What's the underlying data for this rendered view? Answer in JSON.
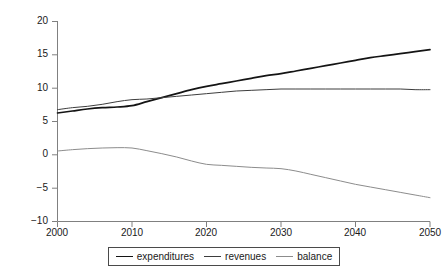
{
  "chart_data": {
    "type": "line",
    "title": "",
    "subtitle": "",
    "xlabel": "",
    "ylabel": "percentage of GDP",
    "xlim": [
      2000,
      2050
    ],
    "ylim": [
      -10,
      20
    ],
    "grid": false,
    "legend_position": "bottom",
    "x_ticks": [
      "2000",
      "2010",
      "2020",
      "2030",
      "2040",
      "2050"
    ],
    "y_ticks": [
      "20",
      "15",
      "10",
      "5",
      "0",
      "−5",
      "−10"
    ],
    "x": [
      2000,
      2002,
      2004,
      2006,
      2008,
      2010,
      2012,
      2014,
      2016,
      2018,
      2020,
      2022,
      2024,
      2026,
      2028,
      2030,
      2032,
      2034,
      2036,
      2038,
      2040,
      2042,
      2044,
      2046,
      2048,
      2050
    ],
    "series": [
      {
        "name": "expenditures",
        "color": "#141414",
        "width": 1.7,
        "values": [
          6.2,
          6.5,
          6.8,
          7.0,
          7.1,
          7.3,
          7.9,
          8.5,
          9.1,
          9.7,
          10.2,
          10.6,
          11.0,
          11.4,
          11.8,
          12.1,
          12.5,
          12.9,
          13.3,
          13.7,
          14.1,
          14.5,
          14.8,
          15.1,
          15.4,
          15.7
        ]
      },
      {
        "name": "revenues",
        "color": "#3d3d3d",
        "width": 1.0,
        "values": [
          6.7,
          7.0,
          7.2,
          7.5,
          7.9,
          8.2,
          8.3,
          8.5,
          8.7,
          8.9,
          9.1,
          9.3,
          9.5,
          9.6,
          9.7,
          9.8,
          9.8,
          9.8,
          9.8,
          9.8,
          9.8,
          9.8,
          9.8,
          9.8,
          9.7,
          9.7
        ]
      },
      {
        "name": "balance",
        "color": "#8c8c8c",
        "width": 1.0,
        "values": [
          0.5,
          0.7,
          0.85,
          0.95,
          1.0,
          0.95,
          0.55,
          0.1,
          -0.4,
          -1.0,
          -1.5,
          -1.65,
          -1.8,
          -1.95,
          -2.05,
          -2.15,
          -2.5,
          -3.0,
          -3.5,
          -4.0,
          -4.5,
          -4.9,
          -5.3,
          -5.7,
          -6.1,
          -6.5
        ]
      }
    ]
  },
  "legend": {
    "items": [
      {
        "label": "expenditures"
      },
      {
        "label": "revenues"
      },
      {
        "label": "balance"
      }
    ]
  },
  "axis": {
    "y_label": "percentage of GDP"
  }
}
